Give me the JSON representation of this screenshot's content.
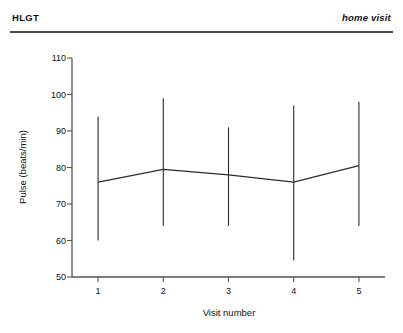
{
  "header": {
    "left_title": "HLGT",
    "right_title": "home visit"
  },
  "chart_data": {
    "type": "line",
    "title": "",
    "subtitle": "",
    "xlabel": "Visit number",
    "ylabel": "Pulse (beats/min)",
    "x": [
      1,
      2,
      3,
      4,
      5
    ],
    "xticklabels": [
      "1",
      "2",
      "3",
      "4",
      "5"
    ],
    "yticklabels": [
      "50",
      "60",
      "70",
      "80",
      "90",
      "100",
      "110"
    ],
    "yticks": [
      50,
      60,
      70,
      80,
      90,
      100,
      110
    ],
    "xlim": [
      0.6,
      5.4
    ],
    "ylim": [
      50,
      110
    ],
    "grid": false,
    "legend": null,
    "series": [
      {
        "name": "Pulse",
        "values": [
          76,
          79.5,
          78,
          76,
          80.5
        ],
        "error_low": [
          60,
          64,
          64,
          54.5,
          64
        ],
        "error_high": [
          94,
          99,
          91,
          97,
          98
        ],
        "marker": "none",
        "line_color": "#2b2b2b"
      }
    ]
  },
  "axis": {
    "line_color": "#555555"
  }
}
